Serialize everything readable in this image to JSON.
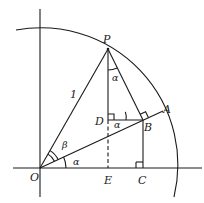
{
  "diagram": {
    "type": "geometry",
    "points": {
      "O": "O",
      "P": "P",
      "A": "A",
      "B": "B",
      "C": "C",
      "D": "D",
      "E": "E"
    },
    "labels": {
      "radius": "1",
      "alpha_at_O": "α",
      "beta_at_O": "β",
      "alpha_at_P": "α",
      "alpha_at_D": "α"
    },
    "right_angles": [
      "D",
      "B",
      "C"
    ],
    "segments": [
      "OP",
      "OA",
      "PB",
      "PE (PD solid, DE dashed)",
      "DB",
      "BC",
      "OC axis",
      "vertical axis"
    ],
    "arc": "unit circle arc centered at O"
  }
}
